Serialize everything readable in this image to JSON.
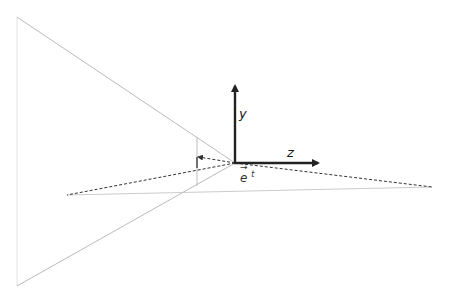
{
  "diagram": {
    "labels": {
      "y_axis": "y",
      "z_axis": "z",
      "vector_base": "e",
      "vector_arrow": "→",
      "vector_superscript": "t"
    },
    "colors": {
      "axis": "#222222",
      "frustum_line": "#bbbbbb",
      "dashed": "#333333",
      "background": "#ffffff"
    },
    "points": {
      "origin": [
        235,
        163
      ],
      "frustum_top_left": [
        17,
        17
      ],
      "frustum_bottom_left": [
        17,
        286
      ],
      "plane_left": [
        67,
        195
      ],
      "plane_right": [
        432,
        187
      ],
      "projection_x": 197,
      "projection_point": [
        197,
        157
      ],
      "y_axis_tip": [
        235,
        84
      ],
      "z_axis_tip": [
        318,
        163
      ]
    }
  }
}
